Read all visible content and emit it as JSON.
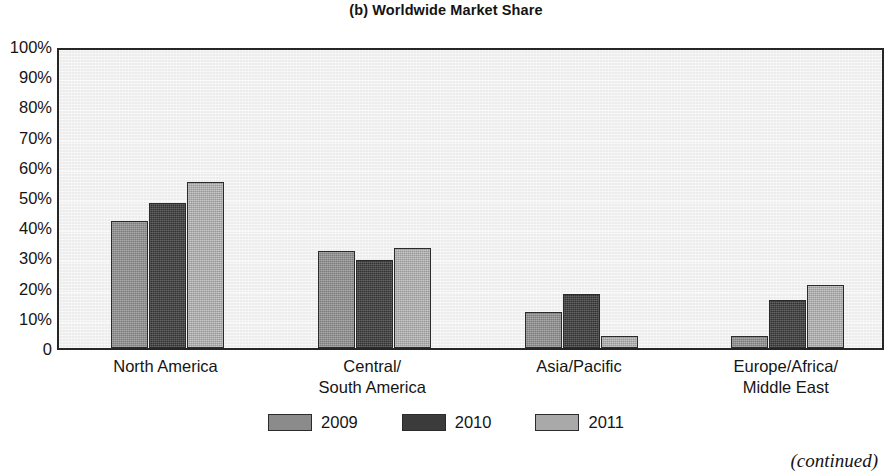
{
  "chart_data": {
    "type": "bar",
    "title": "(b) Worldwide Market Share",
    "xlabel": "",
    "ylabel": "",
    "ylim": [
      0,
      100
    ],
    "grid": true,
    "legend_position": "bottom-center",
    "categories": [
      "North America",
      "Central/\nSouth America",
      "Asia/Pacific",
      "Europe/Africa/\nMiddle East"
    ],
    "ytick_labels": [
      "100%",
      "90%",
      "80%",
      "70%",
      "60%",
      "50%",
      "40%",
      "30%",
      "20%",
      "10%",
      "0"
    ],
    "ytick_values": [
      100,
      90,
      80,
      70,
      60,
      50,
      40,
      30,
      20,
      10,
      0
    ],
    "series": [
      {
        "name": "2009",
        "color": "#8b8b8b",
        "values": [
          42,
          32,
          12,
          4
        ]
      },
      {
        "name": "2010",
        "color": "#3b3b3b",
        "values": [
          48,
          29,
          18,
          16
        ]
      },
      {
        "name": "2011",
        "color": "#a9a9a9",
        "values": [
          55,
          33,
          4,
          21
        ]
      }
    ]
  },
  "legend": {
    "items": [
      {
        "label": "2009"
      },
      {
        "label": "2010"
      },
      {
        "label": "2011"
      }
    ]
  },
  "footer": {
    "continued_label": "(continued)"
  },
  "colors": {
    "series_2009": "#8b8b8b",
    "series_2010": "#3b3b3b",
    "series_2011": "#a9a9a9",
    "plot_background": "#ececec",
    "axis_border": "#262626",
    "text": "#151515",
    "page_background": "#ffffff"
  }
}
